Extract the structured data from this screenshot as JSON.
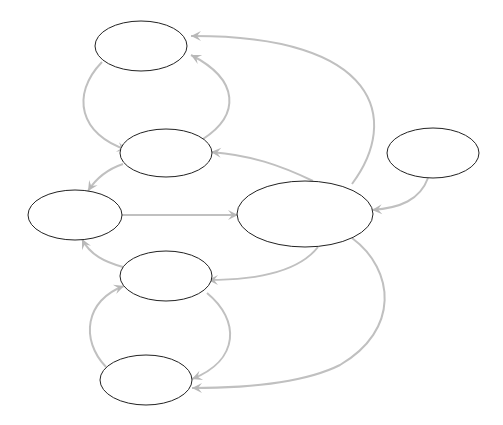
{
  "diagram": {
    "type": "directed-graph",
    "colors": {
      "node_stroke": "#222222",
      "edge": "#c0c0c0",
      "background": "#ffffff"
    },
    "nodes": [
      {
        "id": "A",
        "label": "",
        "cx": 141,
        "cy": 46,
        "rx": 46,
        "ry": 25
      },
      {
        "id": "B",
        "label": "",
        "cx": 166,
        "cy": 153,
        "rx": 46,
        "ry": 24
      },
      {
        "id": "C",
        "label": "",
        "cx": 75,
        "cy": 215,
        "rx": 47,
        "ry": 25
      },
      {
        "id": "D",
        "label": "",
        "cx": 305,
        "cy": 214,
        "rx": 68,
        "ry": 33
      },
      {
        "id": "E",
        "label": "",
        "cx": 433,
        "cy": 153,
        "rx": 46,
        "ry": 25
      },
      {
        "id": "F",
        "label": "",
        "cx": 166,
        "cy": 276,
        "rx": 46,
        "ry": 25
      },
      {
        "id": "G",
        "label": "",
        "cx": 146,
        "cy": 380,
        "rx": 46,
        "ry": 25
      }
    ],
    "edges": [
      {
        "from": "A",
        "to": "B",
        "path": "M102,62 C70,95 80,135 127,150",
        "head": [
          127,
          150
        ]
      },
      {
        "from": "B",
        "to": "A",
        "path": "M203,139 C240,115 240,80 191,55",
        "head": [
          191,
          55
        ]
      },
      {
        "from": "D",
        "to": "A",
        "path": "M352,184 C400,120 380,35 191,36",
        "head": [
          191,
          36
        ]
      },
      {
        "from": "D",
        "to": "B",
        "path": "M313,181 C280,165 250,155 211,152",
        "head": [
          211,
          152
        ]
      },
      {
        "from": "B",
        "to": "C",
        "path": "M123,164 C105,170 95,180 88,191",
        "head": [
          88,
          191
        ]
      },
      {
        "from": "C",
        "to": "D",
        "path": "M122,215 L238,215",
        "head": [
          238,
          215
        ]
      },
      {
        "from": "E",
        "to": "D",
        "path": "M428,178 C420,200 400,208 372,210",
        "head": [
          372,
          210
        ]
      },
      {
        "from": "F",
        "to": "C",
        "path": "M123,267 C105,262 90,255 82,239",
        "head": [
          82,
          239
        ]
      },
      {
        "from": "D",
        "to": "F",
        "path": "M318,247 C300,270 260,280 208,280",
        "head": [
          208,
          280
        ]
      },
      {
        "from": "G",
        "to": "F",
        "path": "M106,367 C80,340 85,300 124,286",
        "head": [
          124,
          286
        ]
      },
      {
        "from": "F",
        "to": "G",
        "path": "M207,293 C240,320 240,360 192,379",
        "head": [
          192,
          379
        ]
      },
      {
        "from": "D",
        "to": "G",
        "path": "M352,238 C395,270 400,330 340,365 C300,385 240,388 192,388",
        "head": [
          192,
          388
        ]
      }
    ]
  }
}
